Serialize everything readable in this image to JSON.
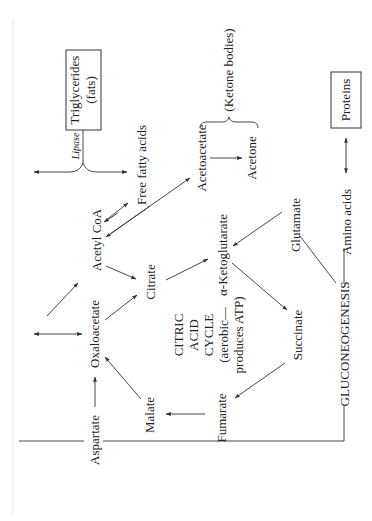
{
  "diagram": {
    "orientation": "rotated-90-ccw",
    "boxes": {
      "triglycerides": {
        "line1": "Triglycerides",
        "line2": "(fats)"
      },
      "proteins": "Proteins"
    },
    "enzyme": {
      "lipase": "Lipase"
    },
    "ketone_group": {
      "label": "(Ketone bodies)"
    },
    "nodes": {
      "free_fatty_acids": "Free fatty acids",
      "acetoacetate": "Acetoacetate",
      "acetone": "Acetone",
      "acetyl_coa": "Acetyl CoA",
      "citrate": "Citrate",
      "alpha_ketoglutarate": "α-Ketoglutarate",
      "glutamate": "Glutamate",
      "amino_acids": "Amino acids",
      "oxaloacetate": "Oxaloacetate",
      "succinate": "Succinate",
      "fumarate": "Fumarate",
      "malate": "Malate",
      "aspartate": "Aspartate",
      "gluconeogenesis": "GLUCONEOGENESIS"
    },
    "cycle_label": {
      "line1": "CITRIC",
      "line2": "ACID",
      "line3": "CYCLE",
      "line4": "(aerobic—",
      "line5": "produces ATP)"
    },
    "edges": [
      {
        "from": "Triglycerides",
        "to": "Free fatty acids",
        "label": "Lipase"
      },
      {
        "from": "Free fatty acids",
        "to": "Acetyl CoA",
        "type": "bidirectional"
      },
      {
        "from": "Acetyl CoA",
        "to": "Acetoacetate",
        "type": "bidirectional"
      },
      {
        "from": "Acetoacetate",
        "to": "Acetone"
      },
      {
        "from": "Amino acids",
        "to": "Proteins",
        "type": "bidirectional"
      },
      {
        "from": "Acetyl CoA",
        "to": "Citrate"
      },
      {
        "from": "Oxaloacetate",
        "to": "Citrate"
      },
      {
        "from": "Citrate",
        "to": "α-Ketoglutarate"
      },
      {
        "from": "Glutamate",
        "to": "α-Ketoglutarate"
      },
      {
        "from": "α-Ketoglutarate",
        "to": "Succinate"
      },
      {
        "from": "Succinate",
        "to": "Fumarate"
      },
      {
        "from": "Fumarate",
        "to": "Malate"
      },
      {
        "from": "Malate",
        "to": "Oxaloacetate"
      },
      {
        "from": "Aspartate",
        "to": "Oxaloacetate"
      },
      {
        "from": "Oxaloacetate",
        "to": "Acetyl CoA"
      },
      {
        "from": "GLUCONEOGENESIS",
        "to": "Glutamate",
        "type": "line"
      },
      {
        "from": "GLUCONEOGENESIS",
        "to": "Amino acids",
        "type": "line"
      },
      {
        "from": "GLUCONEOGENESIS",
        "to": "Aspartate",
        "type": "line"
      }
    ]
  }
}
